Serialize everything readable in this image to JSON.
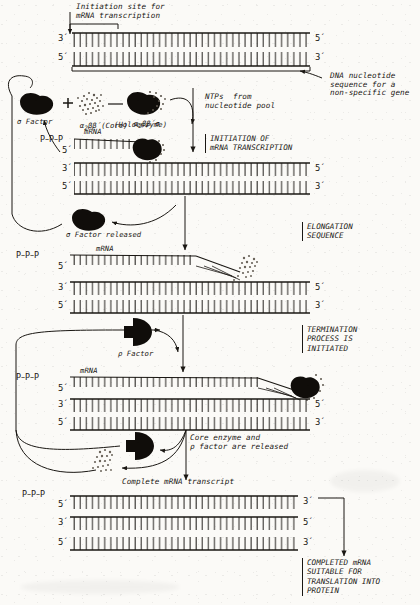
{
  "figure": {
    "ink_color": "#1a1713",
    "paper_color": "#fbfaf7"
  },
  "annotations": {
    "initiation_site": "Initiation site for\nmRNA transcription",
    "dna_sequence": "DNA nucleotide\nsequence for a\nnon-specific gene",
    "ntps": "NTPs  from\nnucleotide pool",
    "sigma_factor": "σ Factor",
    "core_enzyme": "(Core)",
    "core_formula_alpha": "α",
    "core_formula_sub": "2",
    "core_formula_rest": "ββ´",
    "holo_formula_alpha": "α",
    "holo_formula_sub": "2",
    "holo_formula_rest": "ββ´σ",
    "holoenzyme": "(Holoenzyme)",
    "sigma_released": "σ Factor released",
    "rho_factor": "ρ Factor",
    "core_rho_released": "Core enzyme and\nρ factor are released",
    "complete_transcript": "Complete mRNA transcript",
    "mrna": "mRNA",
    "ppp": "P–P–P"
  },
  "stages": [
    {
      "id": "initiation",
      "text": "INITIATION OF\nmRNA TRANSCRIPTION"
    },
    {
      "id": "elongation",
      "text": "ELONGATION\nSEQUENCE"
    },
    {
      "id": "termination",
      "text": "TERMINATION\nPROCESS IS\nINITIATED"
    },
    {
      "id": "completed",
      "text": "COMPLETED mRNA\nSUITABLE FOR\nTRANSLATION INTO\nPROTEIN"
    }
  ],
  "strand_ends": {
    "three_prime": "3´",
    "five_prime": "5´"
  },
  "panels": [
    {
      "id": "panel-1-template-dna",
      "rows": [
        {
          "left": "3´",
          "right": "5´"
        },
        {
          "left": "5´",
          "right": "3´"
        }
      ]
    },
    {
      "id": "panel-2-initiation",
      "rows": [
        {
          "left": "5´",
          "right": ""
        },
        {
          "left": "3´",
          "right": "5´"
        },
        {
          "left": "5´",
          "right": "3´"
        }
      ]
    },
    {
      "id": "panel-3-elongation",
      "rows": [
        {
          "left": "5´",
          "right": ""
        },
        {
          "left": "3´",
          "right": "5´"
        },
        {
          "left": "5´",
          "right": "3´"
        }
      ]
    },
    {
      "id": "panel-4-termination",
      "rows": [
        {
          "left": "5´",
          "right": ""
        },
        {
          "left": "3´",
          "right": "5´"
        },
        {
          "left": "5´",
          "right": "3´"
        }
      ]
    },
    {
      "id": "panel-5-complete",
      "rows": [
        {
          "left": "5´",
          "right": "3´"
        },
        {
          "left": "3´",
          "right": "5´"
        },
        {
          "left": "5´",
          "right": "3´"
        }
      ]
    }
  ]
}
